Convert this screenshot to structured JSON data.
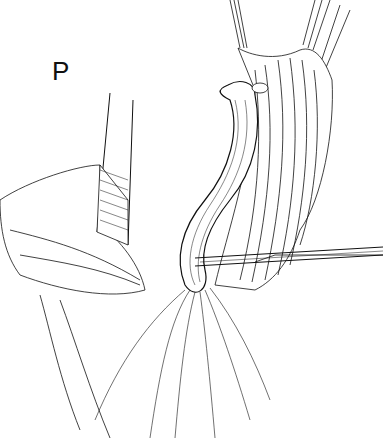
{
  "figure": {
    "panel_label": "P",
    "colors": {
      "ink": "#111111",
      "background": "#ffffff"
    }
  }
}
